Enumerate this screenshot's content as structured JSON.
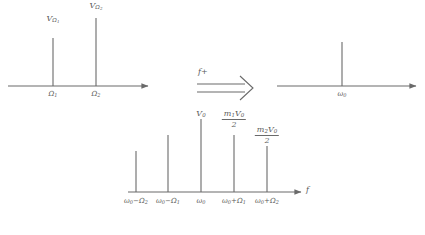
{
  "figure": {
    "type": "signal-spectrum-diagram",
    "stroke_color": "#6a6a6a",
    "text_color": "#5a5a5a"
  },
  "baseband_chart": {
    "name": "baseband-spectrum",
    "axis": {
      "x_start": 8,
      "x_end": 152,
      "baseline_y": 86
    },
    "spikes": [
      {
        "label": "V<sub>Ω<sub>1</sub></sub>",
        "plain_label": "V_Ω₁",
        "x": 53,
        "height": 48,
        "tick": "Ω₁"
      },
      {
        "label": "V<sub>Ω<sub>2</sub></sub>",
        "plain_label": "V_Ω₂",
        "x": 96,
        "height": 68,
        "tick": "Ω₂"
      }
    ],
    "tick_labels": [
      "Ω₁",
      "Ω₂"
    ],
    "amplitude_labels": [
      "VΩ₁",
      "VΩ₂"
    ]
  },
  "transform_arrow": {
    "name": "frequency-shift-arrow",
    "label": "f+",
    "x_start": 197,
    "x_end": 252,
    "y": 88
  },
  "carrier_chart": {
    "name": "carrier-spectrum",
    "axis": {
      "x_start": 277,
      "x_end": 420,
      "baseline_y": 86
    },
    "spikes": [
      {
        "x": 342,
        "height": 44,
        "tick": "ω₀"
      }
    ],
    "tick_labels": [
      "ω₀"
    ]
  },
  "modulated_chart": {
    "name": "modulated-spectrum",
    "axis": {
      "x_start": 128,
      "x_end": 305,
      "baseline_y": 192
    },
    "axis_label": "f",
    "spikes": [
      {
        "x": 136,
        "height": 41,
        "tick": "ω₀−Ω₂",
        "amp_label": ""
      },
      {
        "x": 168,
        "height": 57,
        "tick": "ω₀−Ω₁",
        "amp_label": ""
      },
      {
        "x": 201,
        "height": 73,
        "tick": "ω₀",
        "amp_label": "V₀"
      },
      {
        "x": 234,
        "height": 57,
        "tick": "ω₀+Ω₁",
        "amp_label": "m₁V₀/2"
      },
      {
        "x": 267,
        "height": 46,
        "tick": "ω₀+Ω₂",
        "amp_label": "m₂V₀/2"
      }
    ],
    "tick_labels": [
      "ω₀−Ω₂",
      "ω₀−Ω₁",
      "ω₀",
      "ω₀+Ω₁",
      "ω₀+Ω₂"
    ],
    "amplitude_labels": {
      "center": "V₀",
      "sideband_1": {
        "numerator": "m₁V₀",
        "denominator": "2"
      },
      "sideband_2": {
        "numerator": "m₂V₀",
        "denominator": "2"
      }
    }
  }
}
